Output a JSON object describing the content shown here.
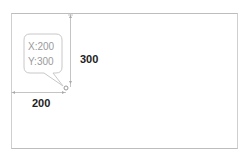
{
  "diagram": {
    "tooltip": {
      "x_text": "X:200",
      "y_text": "Y:300"
    },
    "dimensions": {
      "width_label": "200",
      "height_label": "300"
    },
    "colors": {
      "frame": "#c8c8c8",
      "guide": "#bdbdbd",
      "text": "#222222",
      "tooltip_text": "#9a9a9a"
    }
  }
}
